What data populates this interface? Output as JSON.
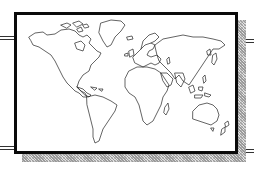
{
  "illustration": {
    "subject": "world-map",
    "style": "line-art clip art with framed border and dithered drop shadow",
    "colors": {
      "background": "#ffffff",
      "frame": "#0a0a0a",
      "outline": "#222222",
      "shadow": "#bdbdbd"
    },
    "continents": [
      "north-america",
      "greenland",
      "south-america",
      "europe",
      "africa",
      "asia",
      "australia",
      "new-zealand",
      "madagascar",
      "japan",
      "indonesia"
    ]
  }
}
